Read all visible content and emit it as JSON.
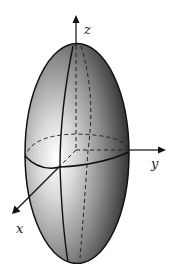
{
  "diagram": {
    "axes": {
      "x": "x",
      "y": "y",
      "z": "z"
    },
    "colors": {
      "surface_dark": "#2a2a2a",
      "surface_light": "#f4f4f4",
      "line": "#111111",
      "background": "#ffffff"
    }
  }
}
